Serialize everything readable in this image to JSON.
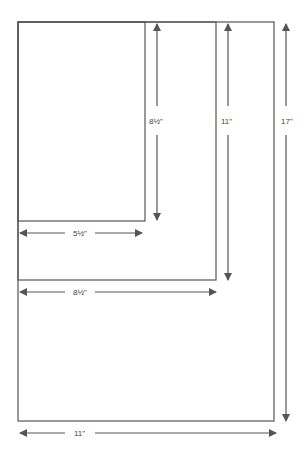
{
  "diagram": {
    "stroke_color": "#555555",
    "sheets": [
      {
        "name": "half-letter",
        "width": "5½\"",
        "height": "8½\""
      },
      {
        "name": "letter",
        "width": "8½\"",
        "height": "11\""
      },
      {
        "name": "tabloid",
        "width": "11\"",
        "height": "17\""
      }
    ],
    "labels": {
      "v1": "8½\"",
      "v2": "11\"",
      "v3": "17\"",
      "h1": "5½\"",
      "h2": "8½\"",
      "h3": "11\""
    }
  }
}
